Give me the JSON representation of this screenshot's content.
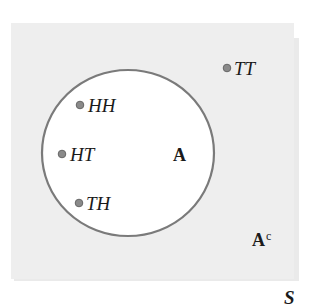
{
  "diagram": {
    "type": "venn",
    "colors": {
      "sample_space_fill": "#eeeeee",
      "sample_space_shadow": "#d9d9d9",
      "event_fill": "#ffffff",
      "event_stroke": "#7a7a7a",
      "point_fill": "#8a8a8a",
      "point_stroke": "#666666",
      "text": "#1a1a1a"
    },
    "sample_space": {
      "label": "S"
    },
    "event": {
      "label": "A",
      "complement_label": "A",
      "complement_superscript": "c"
    },
    "outcomes": [
      {
        "label": "HH",
        "in_event": true
      },
      {
        "label": "HT",
        "in_event": true
      },
      {
        "label": "TH",
        "in_event": true
      },
      {
        "label": "TT",
        "in_event": false
      }
    ]
  }
}
